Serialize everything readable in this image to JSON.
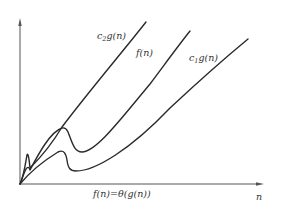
{
  "diagram": {
    "title": "",
    "caption": "f(n)=θ(g(n))",
    "x_axis_label": "n",
    "curves": [
      {
        "id": "c2g",
        "label_main": "c",
        "label_sub": "2",
        "label_rest": "g(n)"
      },
      {
        "id": "f",
        "label_main": "f(n)",
        "label_sub": "",
        "label_rest": ""
      },
      {
        "id": "c1g",
        "label_main": "c",
        "label_sub": "1",
        "label_rest": "g(n)"
      }
    ],
    "colors": {
      "stroke": "#2a2a2a",
      "axis": "#555555",
      "background": "#ffffff"
    }
  }
}
